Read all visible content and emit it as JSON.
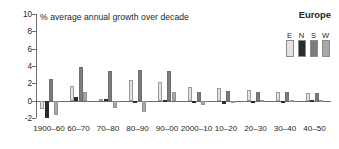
{
  "chart_data": {
    "type": "bar",
    "title": "% average annual growth over decade",
    "xlabel": "",
    "ylabel": "",
    "ylim": [
      -2,
      10
    ],
    "yticks": [
      10,
      8,
      6,
      4,
      2,
      0,
      -2
    ],
    "ytick_labels": [
      "10",
      "8",
      "6",
      "4",
      "2",
      "0",
      "-2"
    ],
    "grid": false,
    "legend_position": "top-right",
    "legend_title": "Europe",
    "categories": [
      "1900–60",
      "60–70",
      "70–80",
      "80–90",
      "90–00",
      "2000–10",
      "10–20",
      "20–30",
      "30–40",
      "40–50"
    ],
    "series": [
      {
        "name": "E",
        "color": "#e4e3e1",
        "values": [
          -1.0,
          1.75,
          0.2,
          2.4,
          2.15,
          1.6,
          1.5,
          1.2,
          1.0,
          0.85
        ]
      },
      {
        "name": "N",
        "color": "#2b2b2b",
        "values": [
          -2.0,
          0.45,
          0.15,
          -0.15,
          0.1,
          -0.25,
          -0.4,
          -0.3,
          -0.25,
          0.05
        ]
      },
      {
        "name": "S",
        "color": "#7c7c7c",
        "values": [
          2.5,
          3.85,
          3.4,
          3.5,
          3.4,
          1.05,
          1.1,
          1.0,
          1.0,
          0.85
        ]
      },
      {
        "name": "W",
        "color": "#a8a8a8",
        "values": [
          -1.7,
          1.05,
          -0.9,
          -1.3,
          1.0,
          -0.5,
          -0.1,
          0.05,
          0.05,
          0.05
        ]
      }
    ]
  },
  "legend": {
    "title": "Europe",
    "entries": [
      {
        "label": "E",
        "color": "#e4e3e1"
      },
      {
        "label": "N",
        "color": "#2b2b2b"
      },
      {
        "label": "S",
        "color": "#7c7c7c"
      },
      {
        "label": "W",
        "color": "#a8a8a8"
      }
    ]
  },
  "axis": {
    "title": "% average annual growth over decade"
  }
}
